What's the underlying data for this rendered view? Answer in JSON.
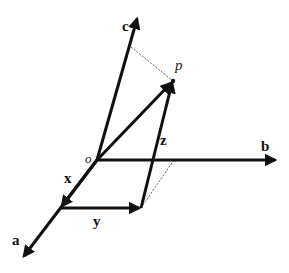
{
  "diagram": {
    "title": "",
    "colors": {
      "stroke": "#111111",
      "background": "#ffffff"
    },
    "points": {
      "origin": {
        "label": "o",
        "x": 97,
        "y": 160
      },
      "p": {
        "label": "p",
        "x": 173,
        "y": 81
      },
      "a_tip": {
        "x": 22,
        "y": 258
      },
      "b_tip": {
        "x": 277,
        "y": 160
      },
      "c_tip": {
        "x": 137,
        "y": 17
      },
      "x_foot": {
        "x": 61,
        "y": 208
      },
      "y_foot": {
        "x": 141,
        "y": 208
      },
      "c_proj": {
        "x": 131,
        "y": 47
      },
      "b_proj": {
        "x": 174,
        "y": 160
      }
    },
    "axes": [
      {
        "name": "a",
        "label": "a"
      },
      {
        "name": "b",
        "label": "b"
      },
      {
        "name": "c",
        "label": "c"
      }
    ],
    "components": [
      {
        "name": "x",
        "label": "x"
      },
      {
        "name": "y",
        "label": "y"
      },
      {
        "name": "z",
        "label": "z"
      }
    ],
    "labels": {
      "a": "a",
      "b": "b",
      "c": "c",
      "o": "o",
      "p": "p",
      "x": "x",
      "y": "y",
      "z": "z"
    }
  }
}
